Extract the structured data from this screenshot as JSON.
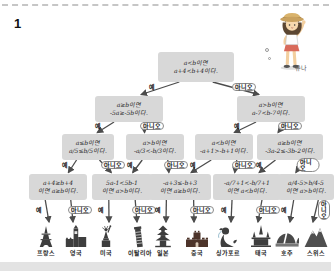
{
  "page": {
    "number_label": "1",
    "character_name": "유나"
  },
  "colors": {
    "box_fill": "#d8d8d8",
    "arrow": "#4c4c4c",
    "icon": "#3e3e3e"
  },
  "flowchart": {
    "yes_label": "예",
    "no_label": "아니오",
    "nodes": {
      "root": {
        "line1": "a<b이면",
        "line2": "a+4<b+4이다."
      },
      "row1": [
        {
          "line1": "a≥b이면",
          "line2": "-5a≥-5b이다."
        },
        {
          "line1": "a>b이면",
          "line2": "a-7<b-7이다."
        }
      ],
      "row2": [
        {
          "line1": "a≤b이면",
          "line2": "a/5≤b/5이다."
        },
        {
          "line1": "a>b이면",
          "line2": "-a/3<-b/3이다."
        },
        {
          "line1": "a<b이면",
          "line2": "-a+1>-b+1이다."
        },
        {
          "line1": "a≥b이면",
          "line2": "-3a-2≤-3b-2이다."
        }
      ],
      "row3": [
        {
          "line1": "a+4≥b+4",
          "line2": "이면 a≥b이다."
        },
        {
          "line1": "5a-1<5b-1",
          "line2": "이면 a>b이다."
        },
        {
          "line1": "-a+3≤-b+3",
          "line2": "이면 a≥b이다."
        },
        {
          "line1": "-a/7+1<-b/7+1",
          "line2": "이면 a<b이다."
        },
        {
          "line1": "a/4-5>b/4-5",
          "line2": "이면 a>b이다."
        }
      ]
    },
    "destinations": [
      {
        "name": "프랑스",
        "icon": "eiffel-tower-icon"
      },
      {
        "name": "영국",
        "icon": "big-ben-icon"
      },
      {
        "name": "미국",
        "icon": "statue-of-liberty-icon"
      },
      {
        "name": "이탈리아",
        "icon": "pisa-tower-icon"
      },
      {
        "name": "일본",
        "icon": "pagoda-icon"
      },
      {
        "name": "중국",
        "icon": "great-wall-icon"
      },
      {
        "name": "싱가포르",
        "icon": "merlion-icon"
      },
      {
        "name": "태국",
        "icon": "thai-temple-icon"
      },
      {
        "name": "호주",
        "icon": "opera-house-icon"
      },
      {
        "name": "스위스",
        "icon": "matterhorn-icon"
      }
    ]
  }
}
